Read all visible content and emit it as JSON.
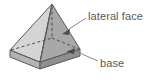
{
  "figure": {
    "type": "geometry-diagram",
    "canvas": {
      "width": 157,
      "height": 80
    },
    "background_color": "#ffffff",
    "colors": {
      "left_lateral_face": "#d5d5d5",
      "right_lateral_face": "#a8a8a8",
      "base_top": "#9c9c9c",
      "base_front_left": "#b4b4b4",
      "base_front_right": "#8f8f8f",
      "outline": "#5a5a5a",
      "hidden_edge": "#4d4d4d",
      "leader_line": "#8a8a8a",
      "text": "#595959"
    },
    "geometry": {
      "apex": [
        52,
        4
      ],
      "base_top_corners": {
        "front": [
          40,
          62
        ],
        "left": [
          10,
          50
        ],
        "back": [
          52,
          38
        ],
        "right": [
          80,
          49
        ]
      },
      "base_thickness": 7
    },
    "hidden_edges": [
      {
        "name": "apex-to-back-vertex",
        "from": [
          52,
          4
        ],
        "to": [
          52,
          38
        ],
        "style": "dashed"
      },
      {
        "name": "back-left-base-edge",
        "from": [
          10,
          50
        ],
        "to": [
          52,
          38
        ],
        "style": "dashed"
      },
      {
        "name": "back-right-base-edge",
        "from": [
          52,
          38
        ],
        "to": [
          80,
          49
        ],
        "style": "dashed"
      }
    ]
  },
  "annotations": [
    {
      "id": "lateral-face",
      "label": "lateral face",
      "label_position": [
        88,
        11
      ],
      "leader_from": [
        86,
        18
      ],
      "leader_to": [
        63,
        33
      ],
      "arrowhead": "at-shape",
      "points_to": "right lateral triangular face"
    },
    {
      "id": "base",
      "label": "base",
      "label_position": [
        100,
        58
      ],
      "leader_from": [
        98,
        61
      ],
      "leader_to": [
        70,
        50
      ],
      "arrowhead": "at-shape",
      "points_to": "square base of the pyramid"
    }
  ]
}
